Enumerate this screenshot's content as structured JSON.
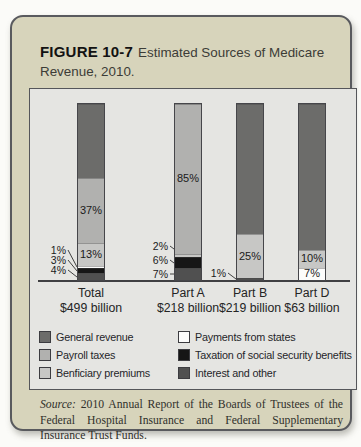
{
  "figure": {
    "label": "FIGURE 10-7",
    "title_line1": "Estimated Sources of Medicare",
    "title_line2": "Revenue, 2010."
  },
  "chart_data": {
    "type": "bar",
    "stacked": true,
    "unit": "percent of category revenue",
    "ylim": [
      0,
      100
    ],
    "categories": [
      "Total",
      "Part A",
      "Part B",
      "Part D"
    ],
    "category_amounts": [
      "$499 billion",
      "$218 billion",
      "$219 billion",
      "$63 billion"
    ],
    "series": [
      {
        "name": "General revenue",
        "key": "general",
        "values": [
          42,
          0,
          74,
          83
        ]
      },
      {
        "name": "Payroll taxes",
        "key": "payroll",
        "values": [
          37,
          85,
          0,
          0
        ]
      },
      {
        "name": "Benficiary premiums",
        "key": "beneficiary",
        "values": [
          13,
          2,
          25,
          10
        ]
      },
      {
        "name": "Payments from states",
        "key": "states",
        "values": [
          1,
          0,
          0,
          7
        ]
      },
      {
        "name": "Taxation of social security benefits",
        "key": "taxation",
        "values": [
          3,
          6,
          0,
          0
        ]
      },
      {
        "name": "Interest and other",
        "key": "interest",
        "values": [
          4,
          7,
          1,
          0
        ]
      }
    ],
    "colors": {
      "general": "#6c6c6a",
      "payroll": "#b1b1af",
      "beneficiary": "#c7c7c5",
      "states": "#fcfcfb",
      "taxation": "#161616",
      "interest": "#505050"
    },
    "stacks": [
      {
        "category": "Total",
        "amount": "$499 billion",
        "segments": [
          {
            "key": "general",
            "pct": 42,
            "label": ""
          },
          {
            "key": "payroll",
            "pct": 37,
            "label": "37%"
          },
          {
            "key": "beneficiary",
            "pct": 13,
            "label": "13%"
          },
          {
            "key": "states",
            "pct": 1,
            "label": ""
          },
          {
            "key": "taxation",
            "pct": 3,
            "label": ""
          },
          {
            "key": "interest",
            "pct": 4,
            "label": ""
          }
        ]
      },
      {
        "category": "Part A",
        "amount": "$218 billion",
        "segments": [
          {
            "key": "payroll",
            "pct": 85,
            "label": "85%"
          },
          {
            "key": "beneficiary",
            "pct": 2,
            "label": ""
          },
          {
            "key": "taxation",
            "pct": 6,
            "label": ""
          },
          {
            "key": "interest",
            "pct": 7,
            "label": ""
          }
        ]
      },
      {
        "category": "Part B",
        "amount": "$219 billion",
        "segments": [
          {
            "key": "general",
            "pct": 74,
            "label": ""
          },
          {
            "key": "beneficiary",
            "pct": 25,
            "label": "25%"
          },
          {
            "key": "interest",
            "pct": 1,
            "label": ""
          }
        ]
      },
      {
        "category": "Part D",
        "amount": "$63 billion",
        "segments": [
          {
            "key": "general",
            "pct": 83,
            "label": ""
          },
          {
            "key": "beneficiary",
            "pct": 10,
            "label": "10%"
          },
          {
            "key": "states",
            "pct": 7,
            "label": "7%"
          }
        ]
      }
    ],
    "callouts": [
      {
        "text": "1%",
        "x": 36,
        "y": 161,
        "tx": 47,
        "ty": 178
      },
      {
        "text": "3%",
        "x": 36,
        "y": 171,
        "tx": 47,
        "ty": 182
      },
      {
        "text": "4%",
        "x": 36,
        "y": 181,
        "tx": 47,
        "ty": 188
      },
      {
        "text": "2%",
        "x": 138,
        "y": 157,
        "tx": 144,
        "ty": 160
      },
      {
        "text": "6%",
        "x": 138,
        "y": 171,
        "tx": 144,
        "ty": 174
      },
      {
        "text": "7%",
        "x": 138,
        "y": 185,
        "tx": 144,
        "ty": 185
      },
      {
        "text": "1%",
        "x": 196,
        "y": 184,
        "tx": 206,
        "ty": 190
      }
    ],
    "legend_position": "below",
    "legend": {
      "left": [
        {
          "key": "general",
          "label": "General revenue"
        },
        {
          "key": "payroll",
          "label": "Payroll taxes"
        },
        {
          "key": "beneficiary",
          "label": "Benficiary premiums"
        }
      ],
      "right": [
        {
          "key": "states",
          "label": "Payments from states"
        },
        {
          "key": "taxation",
          "label": "Taxation of social security benefits"
        },
        {
          "key": "interest",
          "label": "Interest and other"
        }
      ]
    }
  },
  "source": {
    "prefix": "Source:",
    "text": "2010 Annual Report of the Boards of Trustees of the Federal Hospital Insurance and Federal Supplementary Insurance Trust Funds."
  }
}
